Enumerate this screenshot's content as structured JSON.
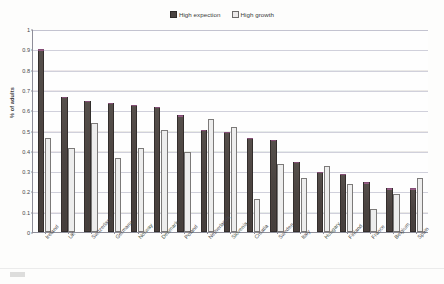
{
  "legend": {
    "entries": [
      {
        "label": "High expection",
        "swatch": "dark-square-icon",
        "color": "#4b4542"
      },
      {
        "label": "High growth",
        "swatch": "light-square-icon",
        "color": "#eceaea"
      }
    ]
  },
  "axes": {
    "ylabel": "% of adults",
    "yticks": [
      "0",
      "0.1",
      "0.2",
      "0.3",
      "0.4",
      "0.5",
      "0.6",
      "0.7",
      "0.8",
      "0.9",
      "1"
    ]
  },
  "chart_data": {
    "type": "bar",
    "title": "",
    "xlabel": "",
    "ylabel": "% of adults",
    "ylim": [
      0,
      1
    ],
    "grid": true,
    "legend_position": "top-center",
    "categories": [
      "Ireland",
      "UK",
      "Switzerland",
      "Germany",
      "Norway",
      "Denmark",
      "Poland",
      "Netherlands",
      "Slovenia",
      "Croatia",
      "Sweden",
      "Italy",
      "Hungary",
      "Finland",
      "France",
      "Belgium",
      "Spain"
    ],
    "series": [
      {
        "name": "High expection",
        "color": "#4b4542",
        "values": [
          0.9,
          0.665,
          0.645,
          0.635,
          0.625,
          0.615,
          0.575,
          0.505,
          0.495,
          0.465,
          0.455,
          0.345,
          0.295,
          0.285,
          0.245,
          0.215,
          0.215
        ]
      },
      {
        "name": "High growth",
        "color": "#ededed",
        "values": [
          0.465,
          0.415,
          0.535,
          0.365,
          0.415,
          0.505,
          0.395,
          0.555,
          0.515,
          0.165,
          0.335,
          0.265,
          0.325,
          0.235,
          0.115,
          0.185,
          0.265
        ]
      }
    ]
  }
}
